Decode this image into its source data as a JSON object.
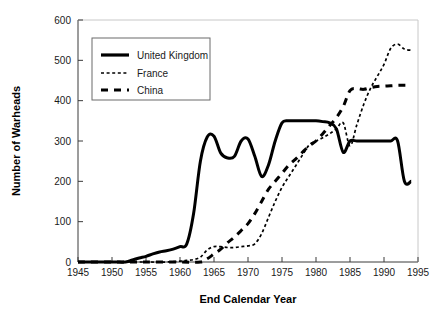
{
  "chart_data": {
    "type": "line",
    "title": "",
    "xlabel": "End Calendar Year",
    "ylabel": "Number of Warheads",
    "xlim": [
      1945,
      1995
    ],
    "ylim": [
      0,
      600
    ],
    "xticks": [
      1945,
      1950,
      1955,
      1960,
      1965,
      1970,
      1975,
      1980,
      1985,
      1990,
      1995
    ],
    "yticks": [
      0,
      100,
      200,
      300,
      400,
      500,
      600
    ],
    "grid": false,
    "legend_position": "top-left inside",
    "series": [
      {
        "name": "United Kingdom",
        "style": "solid",
        "color": "#000000",
        "x": [
          1945,
          1950,
          1952,
          1953,
          1954,
          1955,
          1956,
          1957,
          1958,
          1959,
          1960,
          1961,
          1962,
          1963,
          1964,
          1965,
          1966,
          1967,
          1968,
          1969,
          1970,
          1971,
          1972,
          1973,
          1974,
          1975,
          1976,
          1977,
          1978,
          1979,
          1980,
          1981,
          1982,
          1983,
          1984,
          1985,
          1986,
          1987,
          1988,
          1989,
          1990,
          1991,
          1992,
          1993,
          1994
        ],
        "y": [
          0,
          0,
          0,
          5,
          10,
          14,
          20,
          25,
          28,
          32,
          38,
          45,
          120,
          250,
          310,
          312,
          270,
          258,
          262,
          300,
          305,
          262,
          212,
          240,
          300,
          345,
          350,
          350,
          350,
          350,
          350,
          348,
          345,
          330,
          272,
          300,
          300,
          300,
          300,
          300,
          300,
          300,
          300,
          200,
          200
        ]
      },
      {
        "name": "France",
        "style": "dotted",
        "color": "#000000",
        "x": [
          1945,
          1950,
          1955,
          1958,
          1960,
          1961,
          1962,
          1963,
          1964,
          1965,
          1966,
          1967,
          1968,
          1969,
          1970,
          1971,
          1972,
          1973,
          1974,
          1975,
          1976,
          1977,
          1978,
          1979,
          1980,
          1981,
          1982,
          1983,
          1984,
          1985,
          1986,
          1987,
          1988,
          1989,
          1990,
          1991,
          1992,
          1993,
          1994
        ],
        "y": [
          0,
          0,
          0,
          0,
          2,
          4,
          6,
          12,
          30,
          38,
          38,
          36,
          36,
          38,
          40,
          45,
          70,
          110,
          150,
          185,
          212,
          238,
          265,
          290,
          300,
          308,
          318,
          330,
          345,
          288,
          340,
          390,
          430,
          460,
          490,
          530,
          540,
          528,
          525
        ]
      },
      {
        "name": "China",
        "style": "dashed",
        "color": "#000000",
        "x": [
          1945,
          1950,
          1955,
          1960,
          1963,
          1964,
          1965,
          1966,
          1967,
          1968,
          1969,
          1970,
          1971,
          1972,
          1973,
          1974,
          1975,
          1976,
          1977,
          1978,
          1979,
          1980,
          1981,
          1982,
          1983,
          1984,
          1985,
          1986,
          1987,
          1988,
          1989,
          1990,
          1991,
          1992,
          1993,
          1994
        ],
        "y": [
          0,
          0,
          0,
          0,
          0,
          8,
          20,
          32,
          48,
          62,
          78,
          95,
          120,
          150,
          180,
          200,
          220,
          240,
          255,
          272,
          288,
          300,
          318,
          338,
          358,
          385,
          425,
          430,
          428,
          432,
          435,
          436,
          437,
          438,
          438,
          438
        ]
      }
    ],
    "tick_label_strings": {
      "x": [
        "1945",
        "1950",
        "1955",
        "1960",
        "1965",
        "1970",
        "1975",
        "1980",
        "1985",
        "1990",
        "1995"
      ],
      "y": [
        "0",
        "100",
        "200",
        "300",
        "400",
        "500",
        "600"
      ]
    }
  },
  "legend": {
    "entries": [
      {
        "label": "United Kingdom",
        "style": "solid"
      },
      {
        "label": "France",
        "style": "dotted"
      },
      {
        "label": "China",
        "style": "dashed"
      }
    ]
  },
  "colors": {
    "axis": "#3a3a3a",
    "text": "#1a1a1a",
    "series": "#000000",
    "legend_border": "#6b6b6b",
    "background": "#ffffff"
  }
}
